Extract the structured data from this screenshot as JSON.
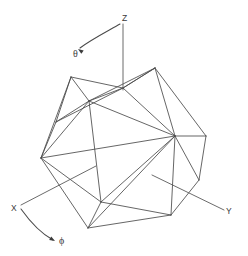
{
  "figure": {
    "background_color": "#ffffff",
    "edge_color": "#4a4a4a",
    "axis_color": "#5a5a5a",
    "label_color": "#3a3a3a",
    "width": 248,
    "height": 256
  },
  "axes": [
    {
      "id": "z",
      "label": "Z",
      "label_x": 122,
      "label_y": 21,
      "line": {
        "x1": 123,
        "y1": 24,
        "x2": 123,
        "y2": 90
      }
    },
    {
      "id": "x",
      "label": "X",
      "label_x": 11,
      "label_y": 211,
      "line": {
        "x1": 21,
        "y1": 205,
        "x2": 96,
        "y2": 166
      }
    },
    {
      "id": "y",
      "label": "Y",
      "label_x": 226,
      "label_y": 214,
      "line": {
        "x1": 152,
        "y1": 175,
        "x2": 224,
        "y2": 210
      }
    }
  ],
  "angles": [
    {
      "id": "theta",
      "symbol": "θ",
      "label_x": 73,
      "label_y": 57,
      "arc_path": "M 120 24 C 108 31, 92 39, 80 48",
      "arrow_tip_x": 78,
      "arrow_tip_y": 49,
      "arrow_angle_deg": 215
    },
    {
      "id": "phi",
      "symbol": "ϕ",
      "label_x": 59,
      "label_y": 244,
      "arc_path": "M 21 209 C 31 223, 42 234, 53 240",
      "arrow_tip_x": 55,
      "arrow_tip_y": 241,
      "arrow_angle_deg": 30
    }
  ],
  "polyhedron": {
    "name": "icosahedron",
    "vertex_count": 12,
    "edge_count": 30,
    "vertices": [
      {
        "id": "v0",
        "name": "top-back",
        "x": 123,
        "y": 88
      },
      {
        "id": "v1",
        "name": "upper-left",
        "x": 71,
        "y": 77
      },
      {
        "id": "v2",
        "name": "upper-front-left",
        "x": 89,
        "y": 101
      },
      {
        "id": "v3",
        "name": "upper-right",
        "x": 155,
        "y": 68
      },
      {
        "id": "v4",
        "name": "mid-left",
        "x": 41,
        "y": 158
      },
      {
        "id": "v5",
        "name": "mid-front-right",
        "x": 175,
        "y": 136
      },
      {
        "id": "v6",
        "name": "mid-right-back",
        "x": 206,
        "y": 136
      },
      {
        "id": "v7",
        "name": "lower-front-left",
        "x": 101,
        "y": 202
      },
      {
        "id": "v8",
        "name": "bottom-left",
        "x": 88,
        "y": 228
      },
      {
        "id": "v9",
        "name": "bottom-right",
        "x": 171,
        "y": 215
      },
      {
        "id": "v10",
        "name": "right-lower-back",
        "x": 199,
        "y": 180
      },
      {
        "id": "v11",
        "name": "left-upper-back",
        "x": 56,
        "y": 122
      }
    ],
    "edges": [
      [
        "v1",
        "v0"
      ],
      [
        "v0",
        "v3"
      ],
      [
        "v1",
        "v2"
      ],
      [
        "v2",
        "v0"
      ],
      [
        "v2",
        "v3"
      ],
      [
        "v3",
        "v5"
      ],
      [
        "v3",
        "v6"
      ],
      [
        "v5",
        "v6"
      ],
      [
        "v1",
        "v11"
      ],
      [
        "v11",
        "v2"
      ],
      [
        "v11",
        "v4"
      ],
      [
        "v1",
        "v4"
      ],
      [
        "v4",
        "v2"
      ],
      [
        "v2",
        "v5"
      ],
      [
        "v2",
        "v7"
      ],
      [
        "v4",
        "v7"
      ],
      [
        "v5",
        "v7"
      ],
      [
        "v5",
        "v9"
      ],
      [
        "v7",
        "v9"
      ],
      [
        "v7",
        "v8"
      ],
      [
        "v8",
        "v9"
      ],
      [
        "v4",
        "v8"
      ],
      [
        "v6",
        "v10"
      ],
      [
        "v5",
        "v10"
      ],
      [
        "v9",
        "v10"
      ],
      [
        "v4",
        "v5"
      ],
      [
        "v11",
        "v0"
      ],
      [
        "v0",
        "v5"
      ],
      [
        "v8",
        "v5"
      ],
      [
        "v3",
        "v0"
      ]
    ]
  }
}
